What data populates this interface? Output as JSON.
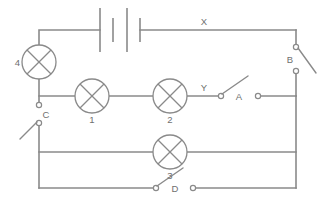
{
  "diagram": {
    "stroke_color": "#8a8a8a",
    "label_color": "#6f6f6f",
    "background": "#ffffff"
  },
  "lamps": [
    {
      "id": "lamp-1",
      "label": "1",
      "cx": 92,
      "cy": 96,
      "r": 17,
      "label_x": 92,
      "label_y": 123
    },
    {
      "id": "lamp-2",
      "label": "2",
      "cx": 170,
      "cy": 96,
      "r": 17,
      "label_x": 170,
      "label_y": 123
    },
    {
      "id": "lamp-3",
      "label": "3",
      "cx": 170,
      "cy": 152,
      "r": 17,
      "label_x": 170,
      "label_y": 179
    },
    {
      "id": "lamp-4",
      "label": "4",
      "cx": 39,
      "cy": 62,
      "r": 17,
      "label_x": 17,
      "label_y": 66
    }
  ],
  "switches": [
    {
      "id": "switch-a",
      "label": "A",
      "state": "open",
      "orientation": "horizontal",
      "label_x": 239,
      "label_y": 100
    },
    {
      "id": "switch-b",
      "label": "B",
      "state": "open",
      "orientation": "vertical",
      "label_x": 290,
      "label_y": 63
    },
    {
      "id": "switch-c",
      "label": "C",
      "state": "open",
      "orientation": "vertical",
      "label_x": 45,
      "label_y": 118
    },
    {
      "id": "switch-d",
      "label": "D",
      "state": "open",
      "orientation": "horizontal",
      "label_x": 174,
      "label_y": 192
    }
  ],
  "battery": {
    "id": "battery",
    "cells": 2,
    "label": ""
  },
  "node_labels": [
    {
      "id": "node-x",
      "label": "X",
      "x": 204,
      "y": 25
    },
    {
      "id": "node-y",
      "label": "Y",
      "x": 204,
      "y": 91
    }
  ]
}
